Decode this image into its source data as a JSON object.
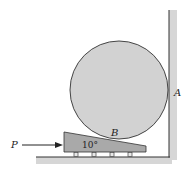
{
  "figure": {
    "labels": {
      "force": "P",
      "contact_wall": "A",
      "contact_wedge": "B",
      "wedge_angle": "10°"
    },
    "colors": {
      "cylinder_fill": "#d2d2d2",
      "wedge_fill": "#a9a9a9",
      "wall_shadow": "#cfcfcf",
      "line": "#333333"
    }
  }
}
